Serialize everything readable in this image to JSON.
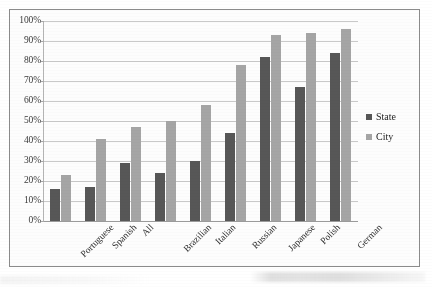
{
  "chart_data": {
    "type": "bar",
    "title": "",
    "subtitle": "",
    "xlabel": "",
    "ylabel": "",
    "ylim": [
      0,
      100
    ],
    "grid": true,
    "legend_position": "right",
    "categories": [
      "Portuguese",
      "Spanish",
      "All",
      "Brazilian",
      "Italian",
      "Russian",
      "Japanese",
      "Polish",
      "German"
    ],
    "ytick_labels": [
      "100%",
      "90%",
      "80%",
      "70%",
      "60%",
      "50%",
      "40%",
      "30%",
      "20%",
      "10%",
      "0%"
    ],
    "ytick_values": [
      100,
      90,
      80,
      70,
      60,
      50,
      40,
      30,
      20,
      10,
      0
    ],
    "series": [
      {
        "name": "State",
        "color": "#575757",
        "values": [
          16,
          17,
          29,
          24,
          30,
          44,
          82,
          67,
          84
        ]
      },
      {
        "name": "City",
        "color": "#a5a5a5",
        "values": [
          23,
          41,
          47,
          50,
          58,
          78,
          93,
          94,
          96
        ]
      }
    ]
  },
  "legend": {
    "items": [
      {
        "label": "State",
        "color": "#575757",
        "marker": "square-swatch-icon"
      },
      {
        "label": "City",
        "color": "#a5a5a5",
        "marker": "square-swatch-icon"
      }
    ]
  }
}
